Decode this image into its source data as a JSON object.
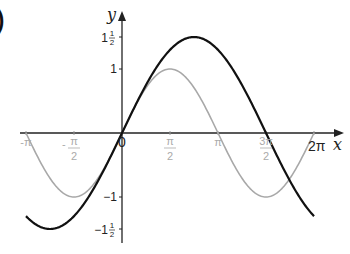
{
  "chart_data": {
    "type": "line",
    "title": "",
    "panel_marker": ")",
    "xlabel": "x",
    "ylabel": "y",
    "xlim": [
      -3.14159,
      6.28318
    ],
    "ylim": [
      -1.5,
      1.5
    ],
    "grid": false,
    "legend": "none",
    "x_ticks": [
      {
        "value": -3.14159,
        "label": "-π"
      },
      {
        "value": -1.5708,
        "label": "-π/2"
      },
      {
        "value": 0,
        "label": "0"
      },
      {
        "value": 1.5708,
        "label": "π/2"
      },
      {
        "value": 3.14159,
        "label": "π"
      },
      {
        "value": 4.71239,
        "label": "3π/2"
      },
      {
        "value": 6.28318,
        "label": "2π"
      }
    ],
    "y_ticks": [
      {
        "value": 1.5,
        "label": "1½"
      },
      {
        "value": 1,
        "label": "1"
      },
      {
        "value": -1,
        "label": "−1"
      },
      {
        "value": -1.5,
        "label": "−1½"
      }
    ],
    "series": [
      {
        "name": "y = sin x",
        "color": "#a8a8a8",
        "function": "sin(x)",
        "x": [
          -3.14159,
          -1.5708,
          0,
          1.5708,
          3.14159,
          4.71239,
          6.28318
        ],
        "values": [
          0,
          -1,
          0,
          1,
          0,
          -1,
          0
        ]
      },
      {
        "name": "y = 1.5 sin(2x/3)",
        "color": "#111111",
        "function": "1.5*sin(2*x/3)",
        "x": [
          -3.14159,
          -2.35619,
          0,
          2.35619,
          4.71239,
          6.28318
        ],
        "values": [
          -1.3,
          -1.5,
          0,
          1.5,
          0,
          -1.3
        ]
      }
    ]
  }
}
